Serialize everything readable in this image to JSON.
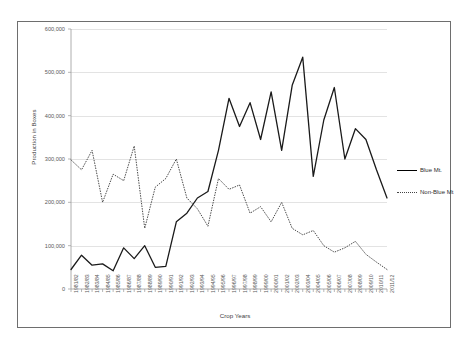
{
  "chart_data": {
    "type": "line",
    "title": "",
    "xlabel": "Crop Years",
    "ylabel": "Production in Boxes",
    "ylim": [
      0,
      600000
    ],
    "ytick_labels": [
      "600,000",
      "500,000",
      "400,000",
      "300,000",
      "200,000",
      "100,000",
      "0"
    ],
    "ytick_values": [
      600000,
      500000,
      400000,
      300000,
      200000,
      100000,
      0
    ],
    "grid": true,
    "legend_position": "right",
    "categories": [
      "1981/82",
      "1982/83",
      "1983/84",
      "1984/85",
      "1985/86",
      "1986/87",
      "1987/88",
      "1988/89",
      "1989/90",
      "1990/91",
      "1991/92",
      "1992/93",
      "1993/94",
      "1994/95",
      "1995/96",
      "1996/97",
      "1997/98",
      "1998/99",
      "1999/00",
      "2000/01",
      "2001/02",
      "2002/03",
      "2003/04",
      "2004/05",
      "2005/06",
      "2006/07",
      "2007/08",
      "2008/09",
      "2009/10",
      "2010/11",
      "2011/12"
    ],
    "series": [
      {
        "name": "Blue Mt.",
        "style": "solid",
        "color": "#1a1a1a",
        "values": [
          45000,
          78000,
          55000,
          58000,
          42000,
          95000,
          70000,
          100000,
          50000,
          52000,
          155000,
          175000,
          210000,
          225000,
          320000,
          440000,
          375000,
          430000,
          345000,
          455000,
          320000,
          470000,
          535000,
          260000,
          390000,
          465000,
          300000,
          370000,
          345000,
          275000,
          210000
        ]
      },
      {
        "name": "Non-Blue Mt",
        "style": "dotted",
        "color": "#4a4a4a",
        "values": [
          298000,
          275000,
          320000,
          200000,
          265000,
          250000,
          330000,
          140000,
          235000,
          255000,
          300000,
          210000,
          185000,
          145000,
          255000,
          230000,
          240000,
          175000,
          190000,
          155000,
          200000,
          140000,
          125000,
          135000,
          100000,
          85000,
          95000,
          110000,
          80000,
          62000,
          45000
        ]
      }
    ]
  },
  "legend": {
    "items": [
      {
        "label": "Blue Mt."
      },
      {
        "label": "Non-Blue Mt"
      }
    ]
  }
}
